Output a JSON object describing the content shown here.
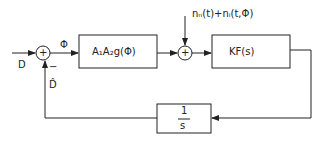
{
  "diagram": {
    "input_label": "D",
    "error_label": "Φ",
    "feedback_label": "D̂",
    "minus_sign": "−",
    "sum1_symbol": "+",
    "sum2_symbol": "+",
    "block1_label": "A₁A₂g(Φ)",
    "noise_label": "nₙ(t)+nᵢ(t,Φ)",
    "block2_label": "KF(s)",
    "integrator_num": "1",
    "integrator_den": "s"
  }
}
